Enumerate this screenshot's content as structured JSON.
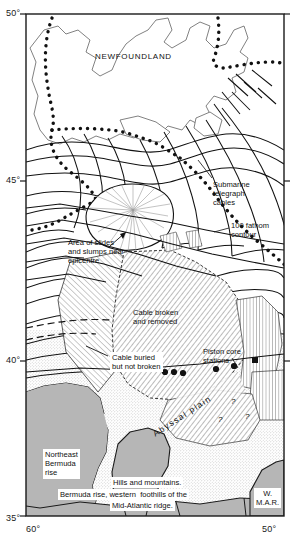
{
  "figure": {
    "kind": "bathymetric-map",
    "region": "Grand Banks of Newfoundland and Northwest Atlantic"
  },
  "axes": {
    "latitude_ticks": [
      "50°",
      "45°",
      "40°",
      "35°"
    ],
    "longitude_ticks": [
      "60°",
      "50°"
    ]
  },
  "labels": {
    "newfoundland": "NEWFOUNDLAND",
    "submarine_cables": "Submarine\ntelegraph\ncables",
    "fathom_contour": "100 fathom\ncontour",
    "slides": "Area of slides\nand slumps near\nepicentre",
    "cable_broken": "Cable broken\nand removed",
    "cable_buried": "Cable buried\nbut not broken",
    "piston_core": "Piston core\nstations",
    "northeast_bermuda_rise": "Northeast\nBermuda\nrise",
    "hills_mountains": "Hills and mountains.",
    "bermuda_foothills": "Bermuda rise, western  foothills of the",
    "mid_atlantic_ridge": "Mid-Atlantic ridge.",
    "w_mar": "W.\nM.A.R.",
    "abyssal_plain": "Abyssal  plain",
    "query_1": "?",
    "query_2": "?",
    "query_3": "?"
  },
  "colors": {
    "ink": "#111111",
    "land_fill": "#ffffff",
    "shaded_relief": "#b9b9b9",
    "stipple": "#d8d8d8",
    "frame": "#1a1a1a"
  },
  "map_data": {
    "piston_core_station_points": [
      {
        "x": 165,
        "y": 372
      },
      {
        "x": 173,
        "y": 372
      },
      {
        "x": 182,
        "y": 372
      },
      {
        "x": 215,
        "y": 369
      },
      {
        "x": 233,
        "y": 366
      },
      {
        "x": 255,
        "y": 361
      }
    ]
  }
}
